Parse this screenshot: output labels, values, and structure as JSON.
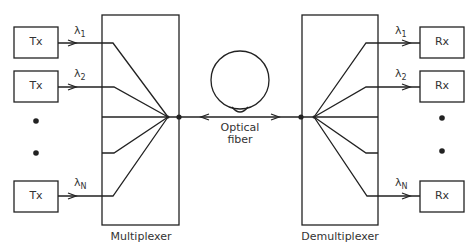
{
  "diagram": {
    "transmitters": [
      {
        "label": "Tx",
        "wavelength": "λ",
        "sub": "1"
      },
      {
        "label": "Tx",
        "wavelength": "λ",
        "sub": "2"
      },
      {
        "label": "Tx",
        "wavelength": "λ",
        "sub": "N"
      }
    ],
    "receivers": [
      {
        "label": "Rx",
        "wavelength": "λ",
        "sub": "1"
      },
      {
        "label": "Rx",
        "wavelength": "λ",
        "sub": "2"
      },
      {
        "label": "Rx",
        "wavelength": "λ",
        "sub": "N"
      }
    ],
    "multiplexer_label": "Multiplexer",
    "demultiplexer_label": "Demultiplexer",
    "fiber_label_line1": "Optical",
    "fiber_label_line2": "fiber",
    "stroke_color": "#222222"
  }
}
